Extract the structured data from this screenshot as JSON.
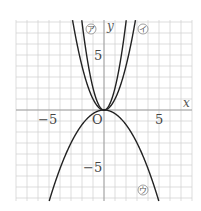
{
  "chart_data": {
    "type": "line",
    "title": "",
    "xlabel": "x",
    "ylabel": "y",
    "origin_label": "O",
    "xlim": [
      -8,
      8
    ],
    "ylim": [
      -8.3,
      8.3
    ],
    "grid": true,
    "x_ticks": [
      {
        "value": -5,
        "label": "−5"
      },
      {
        "value": 5,
        "label": "5"
      }
    ],
    "y_ticks": [
      {
        "value": 5,
        "label": "5"
      },
      {
        "value": -5,
        "label": "−5"
      }
    ],
    "series": [
      {
        "name": "ア",
        "equation": "y = x^2",
        "a": 1
      },
      {
        "name": "イ",
        "equation": "y = 2x^2",
        "a": 2
      },
      {
        "name": "ウ",
        "equation": "y = -x^2/3",
        "a": -0.3333
      }
    ]
  },
  "labels": {
    "x_axis": "x",
    "y_axis": "y",
    "origin": "O",
    "tick_x_neg5": "−5",
    "tick_x_5": "5",
    "tick_y_5": "5",
    "tick_y_neg5": "−5",
    "curve_a": "ア",
    "curve_b": "イ",
    "curve_c": "ウ"
  }
}
